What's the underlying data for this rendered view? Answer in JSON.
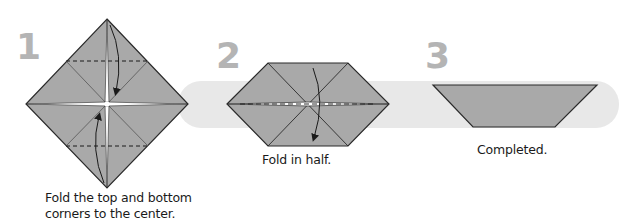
{
  "colors": {
    "paper_fill": "#a9a9a9",
    "band": "#e8e8e8",
    "outline": "#2a2a2a",
    "step_number": "#b4b4b4",
    "text": "#1a1a1a"
  },
  "steps": [
    {
      "number": "1",
      "shape": "diamond",
      "caption_line1": "Fold the top and bottom",
      "caption_line2": "corners to the center.",
      "folds": "valley-folds top and bottom corners to center (dashed lines), arrows"
    },
    {
      "number": "2",
      "shape": "hexagon",
      "caption": "Fold in half.",
      "folds": "horizontal valley fold, arrow top to bottom"
    },
    {
      "number": "3",
      "shape": "trapezoid",
      "caption": "Completed."
    }
  ]
}
